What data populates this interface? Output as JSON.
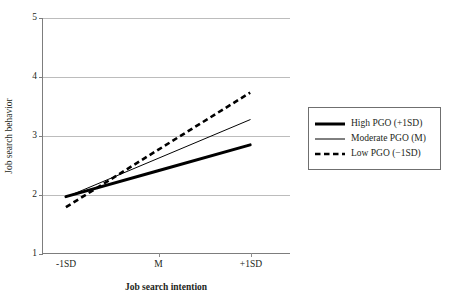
{
  "chart_data": {
    "type": "line",
    "title": "",
    "xlabel": "Job search intention",
    "ylabel": "Job search behavior",
    "x": [
      "-1SD",
      "M",
      "+1SD"
    ],
    "xlim": [
      -1,
      1
    ],
    "ylim": [
      1,
      5
    ],
    "yticks": [
      1,
      2,
      3,
      4,
      5
    ],
    "xticks": [
      "-1SD",
      "M",
      "+1SD"
    ],
    "grid": "horizontal",
    "legend_position": "right",
    "series": [
      {
        "name": "High PGO (+1SD)",
        "style": "thick-solid",
        "color": "#000000",
        "values": [
          1.96,
          2.4,
          2.84
        ]
      },
      {
        "name": "Moderate PGO (M)",
        "style": "thin-solid",
        "color": "#000000",
        "values": [
          1.95,
          2.61,
          3.27
        ]
      },
      {
        "name": "Low PGO (−1SD)",
        "style": "dashed",
        "color": "#000000",
        "values": [
          1.78,
          2.755,
          3.73
        ]
      }
    ]
  },
  "axes": {
    "y": {
      "label": "Job search behavior",
      "ticks": [
        {
          "value": 5,
          "label": "5"
        },
        {
          "value": 4,
          "label": "4"
        },
        {
          "value": 3,
          "label": "3"
        },
        {
          "value": 2,
          "label": "2"
        },
        {
          "value": 1,
          "label": "1"
        }
      ]
    },
    "x": {
      "label": "Job search intention",
      "ticks": [
        {
          "value": -1,
          "label": "-1SD"
        },
        {
          "value": 0,
          "label": "M"
        },
        {
          "value": 1,
          "label": "+1SD"
        }
      ]
    }
  },
  "legend": {
    "items": [
      {
        "label": "High PGO (+1SD)",
        "style": "thick-solid"
      },
      {
        "label": "Moderate PGO (M)",
        "style": "thin-solid"
      },
      {
        "label": "Low PGO (−1SD)",
        "style": "dashed"
      }
    ]
  }
}
